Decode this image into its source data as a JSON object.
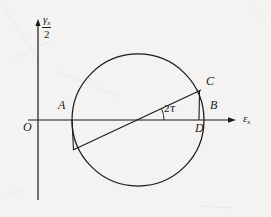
{
  "figure": {
    "background_color": "#f4f3f1",
    "stroke_color": "#1a1a1a",
    "axes": {
      "x_axis": {
        "label": "ε",
        "label_subscript": "x",
        "name": "epsilon-x-axis",
        "y_pixel": 120,
        "x_start": 28,
        "x_end": 232,
        "arrow": "right"
      },
      "y_axis": {
        "label_numerator": "γ",
        "label_numerator_subscript": "x",
        "label_denominator": "2",
        "name": "gamma-over-two-axis",
        "x_pixel": 38,
        "y_start": 22,
        "y_end": 200,
        "arrow": "up"
      },
      "origin_label": "O"
    },
    "circle": {
      "center_x": 138,
      "center_y": 120,
      "radius": 66
    },
    "points": [
      {
        "id": "A",
        "label": "A",
        "x": 72,
        "y": 120,
        "desc": "left intersection of circle with epsilon axis"
      },
      {
        "id": "B",
        "label": "B",
        "x": 204,
        "y": 120,
        "desc": "right intersection of circle with epsilon axis"
      },
      {
        "id": "C",
        "label": "C",
        "x": 199,
        "y": 92,
        "desc": "point on circle at angle 2tau above axis"
      },
      {
        "id": "D",
        "label": "D",
        "x": 199,
        "y": 120,
        "desc": "foot of perpendicular from C onto epsilon axis"
      }
    ],
    "diameter": {
      "name": "diameter-through-C",
      "x1": 73,
      "y1": 150,
      "x2": 202,
      "y2": 90,
      "angle_label": "2τ",
      "angle_number": "2",
      "angle_symbol": "τ",
      "angle_degrees": 25
    },
    "segments": [
      {
        "name": "chord-A-to-lower-left",
        "x1": 72,
        "y1": 120,
        "x2": 73,
        "y2": 150
      },
      {
        "name": "perpendicular-C-to-D",
        "x1": 199,
        "y1": 92,
        "x2": 199,
        "y2": 120
      }
    ],
    "angle_arc": {
      "name": "angle-arc-2tau",
      "cx": 138,
      "cy": 120,
      "r": 26,
      "start_deg": 0,
      "end_deg": 25
    }
  }
}
